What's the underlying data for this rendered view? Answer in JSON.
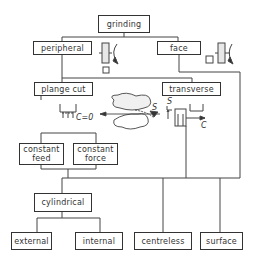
{
  "diagram": {
    "type": "classification tree",
    "root": "grinding",
    "nodes": {
      "grinding": "grinding",
      "peripheral": "peripheral",
      "face": "face",
      "plange_cut": "plange cut",
      "transverse": "transverse",
      "constant_feed": "constant feed",
      "constant_force": "constant force",
      "cylindrical": "cylindrical",
      "external": "external",
      "internal": "internal",
      "centreless": "centreless",
      "surface": "surface"
    },
    "annotations": {
      "c_zero": "C=0",
      "s_label_left": "S",
      "s_label_right": "S",
      "c_label": "C"
    },
    "edges": [
      [
        "grinding",
        "peripheral"
      ],
      [
        "grinding",
        "face"
      ],
      [
        "peripheral",
        "plange cut"
      ],
      [
        "peripheral",
        "transverse"
      ],
      [
        "plange cut",
        "constant feed"
      ],
      [
        "plange cut",
        "constant force"
      ],
      [
        "constant feed",
        "cylindrical"
      ],
      [
        "constant force",
        "cylindrical"
      ],
      [
        "transverse",
        "cylindrical"
      ],
      [
        "transverse",
        "centreless"
      ],
      [
        "transverse",
        "surface"
      ],
      [
        "face",
        "surface"
      ],
      [
        "cylindrical",
        "external"
      ],
      [
        "cylindrical",
        "internal"
      ]
    ]
  }
}
